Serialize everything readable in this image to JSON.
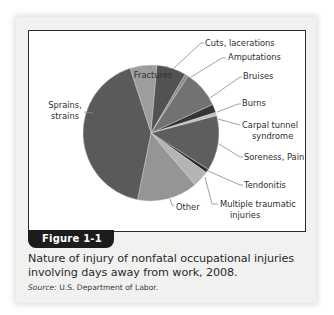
{
  "figure": {
    "tab_label": "Figure 1-1",
    "caption": "Nature of injury of nonfatal occupational injuries involving days away from work, 2008.",
    "source_label": "Source:",
    "source_text": " U.S. Department of Labor."
  },
  "chart_data": {
    "type": "pie",
    "title": "Nature of injury of nonfatal occupational injuries involving days away from work, 2008",
    "units": "percent (estimated from slice angles)",
    "start_angle_deg": -18,
    "direction": "clockwise",
    "slices": [
      {
        "label": "Fractures",
        "value": 6.4,
        "color": "#9d9d9f",
        "label_lines": [
          "Fractures"
        ]
      },
      {
        "label": "Cuts, lacerations",
        "value": 7.0,
        "color": "#525254",
        "label_lines": [
          "Cuts, lacerations"
        ]
      },
      {
        "label": "Amputations",
        "value": 0.8,
        "color": "#8a8a8c",
        "label_lines": [
          "Amputations"
        ]
      },
      {
        "label": "Bruises",
        "value": 8.9,
        "color": "#727274",
        "label_lines": [
          "Bruises"
        ]
      },
      {
        "label": "Burns",
        "value": 2.0,
        "color": "#353537",
        "label_lines": [
          "Burns"
        ]
      },
      {
        "label": "Carpal tunnel syndrome",
        "value": 0.8,
        "color": "#c2c2c2",
        "label_lines": [
          "Carpal tunnel",
          "syndrome"
        ]
      },
      {
        "label": "Soreness, Pain",
        "value": 13.1,
        "color": "#5e5e60",
        "label_lines": [
          "Soreness, Pain"
        ]
      },
      {
        "label": "Tendonitis",
        "value": 0.9,
        "color": "#2e2e30",
        "label_lines": [
          "Tendonitis"
        ]
      },
      {
        "label": "Multiple traumatic injuries",
        "value": 3.9,
        "color": "#b4b4b6",
        "label_lines": [
          "Multiple traumatic",
          "injuries"
        ]
      },
      {
        "label": "Other",
        "value": 14.4,
        "color": "#959597",
        "label_lines": [
          "Other"
        ]
      },
      {
        "label": "Sprains, strains",
        "value": 41.8,
        "color": "#5a5a5c",
        "label_lines": [
          "Sprains,",
          "strains"
        ]
      }
    ],
    "legend": "none (leader-line labels)"
  }
}
